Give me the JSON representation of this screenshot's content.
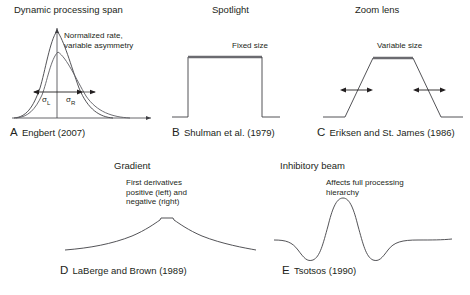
{
  "figure": {
    "background": "#ffffff",
    "stroke_color": "#3f3f44",
    "thick_stroke_color": "#6b6b70",
    "text_color": "#231f20",
    "width": 470,
    "height": 295
  },
  "panels": [
    {
      "id": "A",
      "letter": "A",
      "title": "Dynamic processing span",
      "annotation": "Normalized rate,\nvariable asymmetry",
      "reference": "Engbert (2007)",
      "shape": "two-asymmetric-gaussians-with-axes",
      "labels": {
        "sigma_left": "σ",
        "sigma_left_sub": "L",
        "sigma_right": "σ",
        "sigma_right_sub": "R"
      }
    },
    {
      "id": "B",
      "letter": "B",
      "title": "Spotlight",
      "annotation": "Fixed size",
      "reference": "Shulman et al. (1979)",
      "shape": "rectangular-pulse"
    },
    {
      "id": "C",
      "letter": "C",
      "title": "Zoom lens",
      "annotation": "Variable size",
      "reference": "Eriksen and St. James (1986)",
      "shape": "trapezoid-with-width-arrows"
    },
    {
      "id": "D",
      "letter": "D",
      "title": "Gradient",
      "annotation": "First derivatives\npositive (left) and\nnegative (right)",
      "reference": "LaBerge and Brown (1989)",
      "shape": "peaked-gradient-curve"
    },
    {
      "id": "E",
      "letter": "E",
      "title": "Inhibitory beam",
      "annotation": "Affects full processing\nhierarchy",
      "reference": "Tsotsos (1990)",
      "shape": "mexican-hat-wavelet"
    }
  ]
}
